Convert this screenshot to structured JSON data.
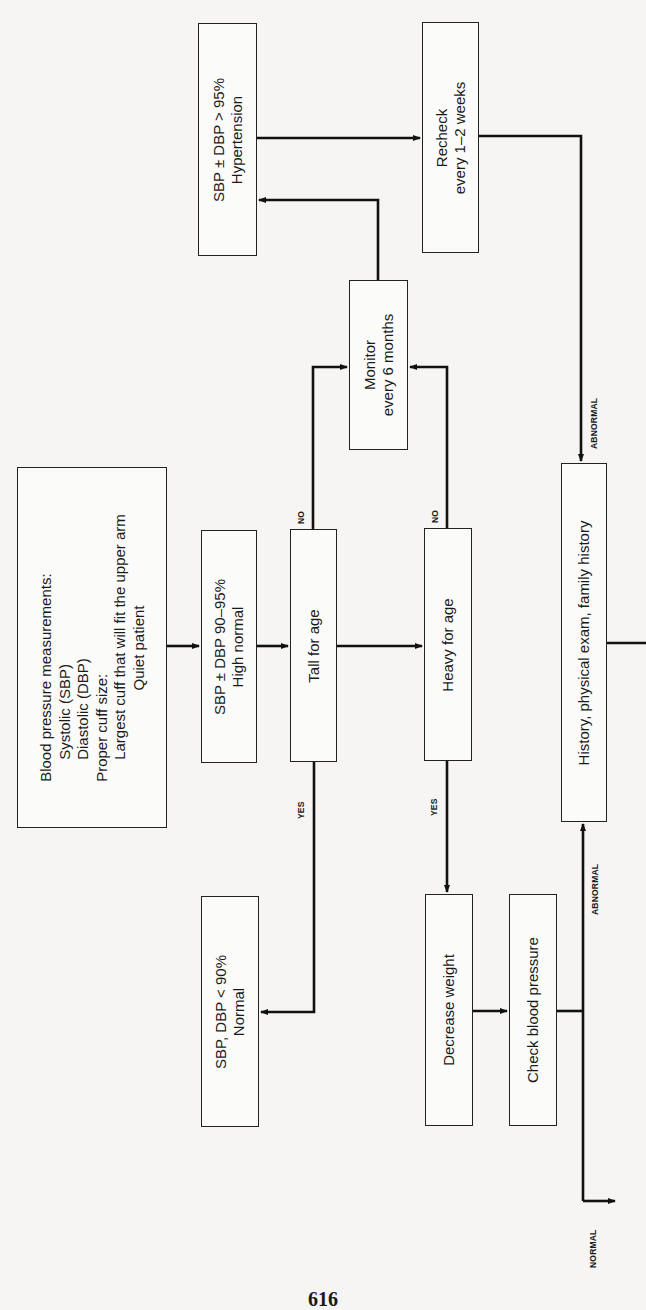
{
  "diagram": {
    "orientation": "rotated-90-ccw",
    "nodes": {
      "measure": {
        "lines": [
          "Blood pressure measurements:",
          "Systolic (SBP)",
          "Diastolic (DBP)",
          "Proper cuff size:",
          "Largest cuff that will fit the upper arm",
          "Quiet patient"
        ]
      },
      "high_normal": {
        "lines": [
          "SBP ± DBP 90–95%",
          "High normal"
        ]
      },
      "tall": {
        "lines": [
          "Tall for age"
        ]
      },
      "heavy": {
        "lines": [
          "Heavy for age"
        ]
      },
      "monitor": {
        "lines": [
          "Monitor",
          "every 6 months"
        ]
      },
      "hypertension": {
        "lines": [
          "SBP ± DBP > 95%",
          "Hypertension"
        ]
      },
      "recheck": {
        "lines": [
          "Recheck",
          "every 1–2 weeks"
        ]
      },
      "normal": {
        "lines": [
          "SBP, DBP < 90%",
          "Normal"
        ]
      },
      "decrease_weight": {
        "lines": [
          "Decrease weight"
        ]
      },
      "check_bp": {
        "lines": [
          "Check blood pressure"
        ]
      },
      "history": {
        "lines": [
          "History, physical exam, family history"
        ]
      }
    },
    "edge_labels": {
      "tall_no": "NO",
      "tall_yes": "YES",
      "heavy_no": "NO",
      "heavy_yes": "YES",
      "recheck_abnormal": "ABNORMAL",
      "check_abnormal": "ABNORMAL",
      "check_normal": "NORMAL"
    },
    "edges": [
      {
        "from": "measure",
        "to": "high_normal"
      },
      {
        "from": "high_normal",
        "to": "tall"
      },
      {
        "from": "tall",
        "to": "heavy"
      },
      {
        "from": "tall",
        "to": "monitor",
        "label": "NO"
      },
      {
        "from": "tall",
        "to": "normal",
        "label": "YES"
      },
      {
        "from": "heavy",
        "to": "monitor",
        "label": "NO"
      },
      {
        "from": "heavy",
        "to": "decrease_weight",
        "label": "YES"
      },
      {
        "from": "monitor",
        "to": "hypertension"
      },
      {
        "from": "hypertension",
        "to": "recheck"
      },
      {
        "from": "recheck",
        "to": "history",
        "label": "ABNORMAL"
      },
      {
        "from": "decrease_weight",
        "to": "check_bp"
      },
      {
        "from": "check_bp",
        "to": "history",
        "label": "ABNORMAL"
      },
      {
        "from": "check_bp",
        "to": "exit",
        "label": "NORMAL"
      }
    ]
  },
  "page": {
    "number": "616"
  }
}
